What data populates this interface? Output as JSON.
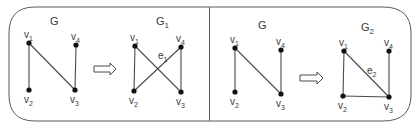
{
  "colors": {
    "frame": "#5a5a5a",
    "edge": "#4a4a4a",
    "node": "#111111",
    "text": "#3a3a3a",
    "arrow": "#4a4a4a",
    "background": "#ffffff"
  },
  "panels": [
    {
      "id": "panel-left",
      "original": {
        "title": "G",
        "title_sub": "",
        "nodes": [
          {
            "id": "v1",
            "label": "v",
            "sub": "1",
            "x": 29,
            "y": 43
          },
          {
            "id": "v4",
            "label": "v",
            "sub": "4",
            "x": 76,
            "y": 45
          },
          {
            "id": "v2",
            "label": "v",
            "sub": "2",
            "x": 29,
            "y": 90
          },
          {
            "id": "v3",
            "label": "v",
            "sub": "3",
            "x": 75,
            "y": 90
          }
        ],
        "edges": [
          [
            "v1",
            "v2"
          ],
          [
            "v1",
            "v3"
          ],
          [
            "v4",
            "v3"
          ]
        ]
      },
      "arrow": {
        "x1": 94,
        "x2": 116,
        "y": 69
      },
      "result": {
        "title": "G",
        "title_sub": "1",
        "nodes": [
          {
            "id": "v1",
            "label": "v",
            "sub": "1",
            "x": 135,
            "y": 46
          },
          {
            "id": "v4",
            "label": "v",
            "sub": "4",
            "x": 181,
            "y": 47
          },
          {
            "id": "v2",
            "label": "v",
            "sub": "2",
            "x": 134,
            "y": 91
          },
          {
            "id": "v3",
            "label": "v",
            "sub": "3",
            "x": 181,
            "y": 92
          }
        ],
        "edges": [
          [
            "v1",
            "v2"
          ],
          [
            "v1",
            "v3"
          ],
          [
            "v4",
            "v3"
          ],
          [
            "v4",
            "v2"
          ]
        ],
        "edge_label": {
          "text": "e",
          "sub": "1",
          "x": 158,
          "y": 59
        }
      }
    },
    {
      "id": "panel-right",
      "original": {
        "title": "G",
        "title_sub": "",
        "nodes": [
          {
            "id": "v1",
            "label": "v",
            "sub": "1",
            "x": 235,
            "y": 48
          },
          {
            "id": "v4",
            "label": "v",
            "sub": "4",
            "x": 281,
            "y": 50
          },
          {
            "id": "v2",
            "label": "v",
            "sub": "2",
            "x": 235,
            "y": 92
          },
          {
            "id": "v3",
            "label": "v",
            "sub": "3",
            "x": 281,
            "y": 94
          }
        ],
        "edges": [
          [
            "v1",
            "v2"
          ],
          [
            "v1",
            "v3"
          ],
          [
            "v4",
            "v3"
          ]
        ]
      },
      "arrow": {
        "x1": 300,
        "x2": 323,
        "y": 78
      },
      "result": {
        "title": "G",
        "title_sub": "2",
        "nodes": [
          {
            "id": "v1",
            "label": "v",
            "sub": "1",
            "x": 344,
            "y": 51
          },
          {
            "id": "v4",
            "label": "v",
            "sub": "4",
            "x": 389,
            "y": 51
          },
          {
            "id": "v2",
            "label": "v",
            "sub": "2",
            "x": 343,
            "y": 96
          },
          {
            "id": "v3",
            "label": "v",
            "sub": "3",
            "x": 389,
            "y": 97
          }
        ],
        "edges": [
          [
            "v1",
            "v2"
          ],
          [
            "v1",
            "v3"
          ],
          [
            "v4",
            "v3"
          ],
          [
            "v2",
            "v3"
          ]
        ],
        "edge_label": {
          "text": "e",
          "sub": "2",
          "x": 367,
          "y": 74
        }
      }
    }
  ],
  "title_positions": [
    {
      "x": 50,
      "y": 25
    },
    {
      "x": 156,
      "y": 25
    },
    {
      "x": 258,
      "y": 29
    },
    {
      "x": 361,
      "y": 31
    }
  ]
}
